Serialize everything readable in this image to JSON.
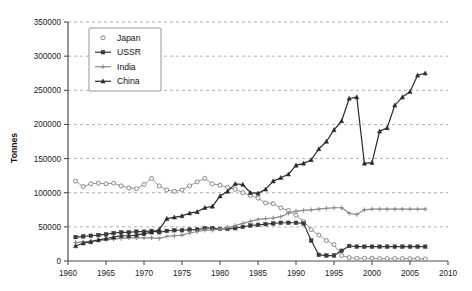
{
  "chart_data": {
    "type": "line",
    "title": "",
    "xlabel": "",
    "ylabel": "Tonnes",
    "xlim": [
      1960,
      2010
    ],
    "ylim": [
      0,
      350000
    ],
    "x_ticks": [
      1960,
      1965,
      1970,
      1975,
      1980,
      1985,
      1990,
      1995,
      2000,
      2005,
      2010
    ],
    "y_ticks": [
      0,
      50000,
      100000,
      150000,
      200000,
      250000,
      300000,
      350000
    ],
    "grid": "horizontal",
    "legend_position": "top-left-inside",
    "x": [
      1961,
      1962,
      1963,
      1964,
      1965,
      1966,
      1967,
      1968,
      1969,
      1970,
      1971,
      1972,
      1973,
      1974,
      1975,
      1976,
      1977,
      1978,
      1979,
      1980,
      1981,
      1982,
      1983,
      1984,
      1985,
      1986,
      1987,
      1988,
      1989,
      1990,
      1991,
      1992,
      1993,
      1994,
      1995,
      1996,
      1997,
      1998,
      1999,
      2000,
      2001,
      2002,
      2003,
      2004,
      2005,
      2006,
      2007
    ],
    "series": [
      {
        "name": "Japan",
        "marker": "open-circle",
        "color": "#7a7a7a",
        "values": [
          117000,
          109000,
          113000,
          114000,
          113000,
          114000,
          110000,
          107000,
          106000,
          112000,
          121000,
          110000,
          104000,
          102000,
          104000,
          110000,
          116000,
          121000,
          113000,
          111000,
          108000,
          105000,
          100000,
          96000,
          92000,
          85000,
          84000,
          78000,
          74000,
          67000,
          58000,
          46000,
          38000,
          30000,
          24000,
          8000,
          5000,
          4000,
          4000,
          4000,
          3500,
          3500,
          3500,
          3500,
          3500,
          3500,
          3000
        ]
      },
      {
        "name": "USSR",
        "marker": "filled-square",
        "color": "#3a3a3a",
        "values": [
          35000,
          36000,
          37000,
          38000,
          39000,
          41000,
          42000,
          42000,
          43000,
          43000,
          44000,
          42000,
          44000,
          45000,
          45000,
          46000,
          46000,
          48000,
          48000,
          47000,
          47000,
          48000,
          50000,
          52000,
          53000,
          54000,
          55000,
          56000,
          56000,
          56000,
          55000,
          30000,
          9000,
          8000,
          8000,
          15000,
          22000,
          21000,
          21000,
          21000,
          21000,
          21000,
          21000,
          21000,
          21000,
          21000,
          21000
        ]
      },
      {
        "name": "India",
        "marker": "plus",
        "color": "#8c8c8c",
        "values": [
          27000,
          28000,
          29000,
          30000,
          31000,
          32000,
          33000,
          34000,
          34000,
          34000,
          34000,
          33000,
          36000,
          37000,
          38000,
          41000,
          43000,
          45000,
          45000,
          47000,
          49000,
          52000,
          55000,
          58000,
          61000,
          62000,
          63000,
          65000,
          70000,
          73000,
          74000,
          75000,
          76000,
          77000,
          78000,
          78000,
          70000,
          68000,
          75000,
          76000,
          76000,
          76000,
          76000,
          76000,
          76000,
          76000,
          76000
        ]
      },
      {
        "name": "China",
        "marker": "filled-triangle",
        "color": "#2a2a2a",
        "values": [
          22000,
          26000,
          28000,
          30000,
          32000,
          34000,
          36000,
          36000,
          37000,
          38000,
          42000,
          44000,
          47000,
          48000,
          50000,
          52000,
          54000,
          57000,
          60000,
          62000,
          66000,
          70000,
          74000,
          76000,
          78000,
          80000,
          82000,
          84000,
          86000,
          88000,
          90000,
          92000,
          94000,
          96000,
          98000,
          100000,
          102000,
          104000,
          106000,
          108000,
          110000,
          112000,
          114000,
          116000,
          118000,
          120000,
          122000
        ]
      }
    ],
    "china_actual": [
      22000,
      26000,
      28000,
      31000,
      33000,
      35000,
      37000,
      37000,
      38000,
      40000,
      42000,
      46000,
      62000,
      64000,
      66000,
      70000,
      72000,
      78000,
      80000,
      95000,
      102000,
      113000,
      112000,
      100000,
      99000,
      105000,
      117000,
      122000,
      127000,
      140000,
      143000,
      148000,
      164000,
      175000,
      192000,
      205000,
      238000,
      240000,
      143000,
      144000,
      190000,
      195000,
      228000,
      240000,
      248000,
      272000,
      275000
    ]
  },
  "legend": {
    "entries": [
      {
        "label": "Japan"
      },
      {
        "label": "USSR"
      },
      {
        "label": "India"
      },
      {
        "label": "China"
      }
    ]
  },
  "axes": {
    "y_title": "Tonnes",
    "y_tick_labels": [
      "0",
      "50000",
      "100000",
      "150000",
      "200000",
      "250000",
      "300000",
      "350000"
    ],
    "x_tick_labels": [
      "1960",
      "1965",
      "1970",
      "1975",
      "1980",
      "1985",
      "1990",
      "1995",
      "2000",
      "2005",
      "2010"
    ]
  }
}
